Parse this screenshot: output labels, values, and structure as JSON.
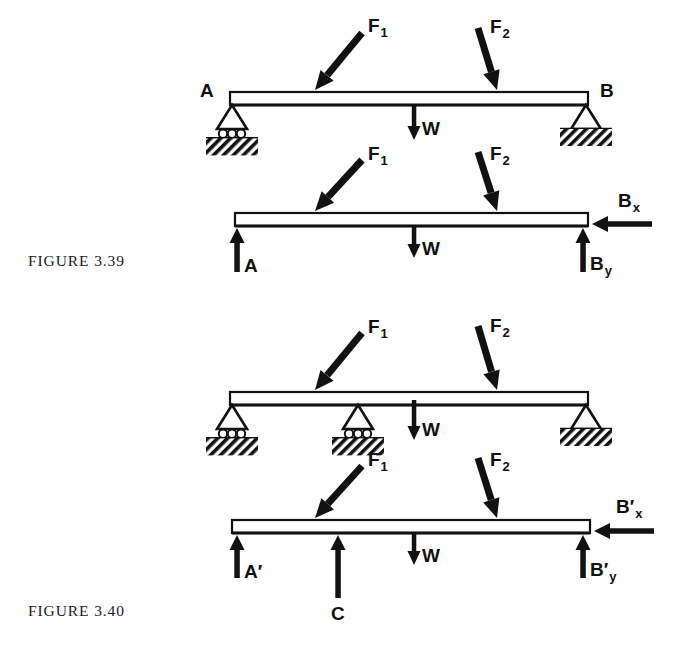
{
  "figure": {
    "captions": [
      {
        "id": "fig-339",
        "text": "FIGURE 3.39"
      },
      {
        "id": "fig-340",
        "text": "FIGURE 3.40"
      }
    ]
  },
  "diagrams": [
    {
      "id": "beam-supported-339",
      "kind": "supported-beam",
      "caption_ref": "FIGURE 3.39",
      "beam": {
        "x1": 230,
        "x2": 588,
        "top": 92,
        "bottom": 105
      },
      "supports": [
        {
          "name": "A",
          "type": "roller",
          "x": 232,
          "label": "A",
          "label_x": 200,
          "label_y": 97
        },
        {
          "name": "B",
          "type": "pin",
          "x": 586,
          "label": "B",
          "label_x": 600,
          "label_y": 97
        }
      ],
      "loads": [
        {
          "name": "F1",
          "label": "F",
          "subscript": "1",
          "type": "applied-force",
          "tail_x": 362,
          "tail_y": 33,
          "head_x": 315,
          "head_y": 90,
          "label_x": 368,
          "label_y": 32
        },
        {
          "name": "F2",
          "label": "F",
          "subscript": "2",
          "type": "applied-force",
          "tail_x": 478,
          "tail_y": 28,
          "head_x": 497,
          "head_y": 90,
          "label_x": 490,
          "label_y": 33
        },
        {
          "name": "W",
          "label": "W",
          "subscript": "",
          "type": "weight",
          "tail_x": 414,
          "tail_y": 104,
          "head_x": 414,
          "head_y": 140,
          "label_x": 422,
          "label_y": 135
        }
      ]
    },
    {
      "id": "fbd-339",
      "kind": "free-body-diagram",
      "caption_ref": "FIGURE 3.39",
      "beam": {
        "x1": 235,
        "x2": 588,
        "top": 213,
        "bottom": 226
      },
      "supports": [],
      "loads": [
        {
          "name": "F1",
          "label": "F",
          "subscript": "1",
          "type": "applied-force",
          "tail_x": 362,
          "tail_y": 160,
          "head_x": 315,
          "head_y": 211,
          "label_x": 368,
          "label_y": 160
        },
        {
          "name": "F2",
          "label": "F",
          "subscript": "2",
          "type": "applied-force",
          "tail_x": 478,
          "tail_y": 152,
          "head_x": 497,
          "head_y": 211,
          "label_x": 490,
          "label_y": 160
        },
        {
          "name": "W",
          "label": "W",
          "subscript": "",
          "type": "weight",
          "tail_x": 414,
          "tail_y": 225,
          "head_x": 414,
          "head_y": 258,
          "label_x": 422,
          "label_y": 255
        },
        {
          "name": "A",
          "label": "A",
          "subscript": "",
          "type": "reaction-up",
          "tail_x": 237,
          "tail_y": 272,
          "head_x": 237,
          "head_y": 228,
          "label_x": 244,
          "label_y": 272
        },
        {
          "name": "By",
          "label": "B",
          "subscript": "y",
          "type": "reaction-up",
          "tail_x": 583,
          "tail_y": 272,
          "head_x": 583,
          "head_y": 228,
          "label_x": 590,
          "label_y": 270
        },
        {
          "name": "Bx",
          "label": "B",
          "subscript": "x",
          "type": "reaction-left",
          "tail_x": 652,
          "tail_y": 224,
          "head_x": 592,
          "head_y": 224,
          "label_x": 618,
          "label_y": 207
        }
      ]
    },
    {
      "id": "beam-supported-340",
      "kind": "supported-beam",
      "caption_ref": "FIGURE 3.40",
      "beam": {
        "x1": 230,
        "x2": 588,
        "top": 392,
        "bottom": 405
      },
      "supports": [
        {
          "name": "A'",
          "type": "roller",
          "x": 232,
          "label": "",
          "label_x": 0,
          "label_y": 0
        },
        {
          "name": "C",
          "type": "roller",
          "x": 358,
          "label": "",
          "label_x": 0,
          "label_y": 0
        },
        {
          "name": "B'",
          "type": "pin",
          "x": 586,
          "label": "",
          "label_x": 0,
          "label_y": 0
        }
      ],
      "loads": [
        {
          "name": "F1",
          "label": "F",
          "subscript": "1",
          "type": "applied-force",
          "tail_x": 362,
          "tail_y": 333,
          "head_x": 315,
          "head_y": 390,
          "label_x": 368,
          "label_y": 333
        },
        {
          "name": "F2",
          "label": "F",
          "subscript": "2",
          "type": "applied-force",
          "tail_x": 478,
          "tail_y": 326,
          "head_x": 497,
          "head_y": 390,
          "label_x": 490,
          "label_y": 332
        },
        {
          "name": "W",
          "label": "W",
          "subscript": "",
          "type": "weight",
          "tail_x": 414,
          "tail_y": 400,
          "head_x": 414,
          "head_y": 440,
          "label_x": 422,
          "label_y": 436
        }
      ]
    },
    {
      "id": "fbd-340",
      "kind": "free-body-diagram",
      "caption_ref": "FIGURE 3.40",
      "beam": {
        "x1": 232,
        "x2": 590,
        "top": 520,
        "bottom": 533
      },
      "supports": [],
      "loads": [
        {
          "name": "F1",
          "label": "F",
          "subscript": "1",
          "type": "applied-force",
          "tail_x": 362,
          "tail_y": 466,
          "head_x": 315,
          "head_y": 518,
          "label_x": 368,
          "label_y": 466
        },
        {
          "name": "F2",
          "label": "F",
          "subscript": "2",
          "type": "applied-force",
          "tail_x": 478,
          "tail_y": 458,
          "head_x": 497,
          "head_y": 518,
          "label_x": 490,
          "label_y": 466
        },
        {
          "name": "W",
          "label": "W",
          "subscript": "",
          "type": "weight",
          "tail_x": 414,
          "tail_y": 532,
          "head_x": 414,
          "head_y": 565,
          "label_x": 422,
          "label_y": 562
        },
        {
          "name": "A'",
          "label": "A′",
          "subscript": "",
          "type": "reaction-up",
          "tail_x": 237,
          "tail_y": 578,
          "head_x": 237,
          "head_y": 535,
          "label_x": 244,
          "label_y": 578
        },
        {
          "name": "C",
          "label": "C",
          "subscript": "",
          "type": "reaction-up",
          "tail_x": 338,
          "tail_y": 598,
          "head_x": 338,
          "head_y": 535,
          "label_x": 331,
          "label_y": 620
        },
        {
          "name": "B'y",
          "label": "B′",
          "subscript": "y",
          "type": "reaction-up",
          "tail_x": 583,
          "tail_y": 578,
          "head_x": 583,
          "head_y": 535,
          "label_x": 590,
          "label_y": 576
        },
        {
          "name": "B'x",
          "label": "B′",
          "subscript": "x",
          "type": "reaction-left",
          "tail_x": 654,
          "tail_y": 531,
          "head_x": 594,
          "head_y": 531,
          "label_x": 616,
          "label_y": 513
        }
      ]
    }
  ],
  "colors": {
    "ink": "#111111",
    "paper": "#ffffff",
    "caption_ink": "#1a1a1a"
  }
}
